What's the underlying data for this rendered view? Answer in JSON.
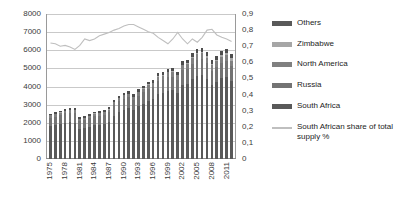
{
  "chart_data": {
    "type": "bar",
    "title": "",
    "subtitle": "",
    "xlabel": "",
    "ylabel": "",
    "y2label": "",
    "grid": true,
    "legend_position": "right",
    "ylim": [
      0,
      8000
    ],
    "yticks": [
      "0",
      "1000",
      "2000",
      "3000",
      "4000",
      "5000",
      "6000",
      "7000",
      "8000"
    ],
    "y2lim": [
      0,
      0.9
    ],
    "y2ticks": [
      "0",
      "0,1",
      "0,2",
      "0,3",
      "0,4",
      "0,5",
      "0,6",
      "0,7",
      "0,8",
      "0,9"
    ],
    "categories": [
      "1975",
      "1976",
      "1977",
      "1978",
      "1979",
      "1980",
      "1981",
      "1982",
      "1983",
      "1984",
      "1985",
      "1986",
      "1987",
      "1988",
      "1989",
      "1990",
      "1991",
      "1992",
      "1993",
      "1994",
      "1995",
      "1996",
      "1997",
      "1998",
      "1999",
      "2000",
      "2001",
      "2002",
      "2003",
      "2004",
      "2005",
      "2006",
      "2007",
      "2008",
      "2009",
      "2010",
      "2011",
      "2012"
    ],
    "xtick_labels": [
      "1975",
      "",
      "",
      "1978",
      "",
      "",
      "1981",
      "",
      "",
      "1984",
      "",
      "",
      "1987",
      "",
      "",
      "1990",
      "",
      "",
      "1993",
      "",
      "",
      "1996",
      "",
      "",
      "1999",
      "",
      "",
      "2002",
      "",
      "",
      "2005",
      "",
      "",
      "2008",
      "",
      "",
      "2011",
      ""
    ],
    "series": [
      {
        "name": "South Africa",
        "color": "#595959",
        "values": [
          1810,
          1850,
          1930,
          2010,
          2020,
          2010,
          1660,
          1690,
          1790,
          1880,
          1900,
          1940,
          2050,
          2400,
          2590,
          2710,
          2800,
          2680,
          2900,
          3050,
          3220,
          3300,
          3580,
          3640,
          3780,
          3800,
          3650,
          4100,
          4150,
          4420,
          4580,
          4620,
          4430,
          4060,
          4250,
          4450,
          4520,
          4280
        ]
      },
      {
        "name": "Russia",
        "color": "#737373",
        "values": [
          480,
          490,
          500,
          510,
          520,
          540,
          440,
          450,
          470,
          490,
          490,
          500,
          520,
          560,
          590,
          610,
          600,
          560,
          590,
          620,
          650,
          660,
          700,
          710,
          730,
          740,
          710,
          790,
          800,
          840,
          870,
          880,
          850,
          800,
          830,
          860,
          870,
          830
        ]
      },
      {
        "name": "North America",
        "color": "#808080",
        "values": [
          120,
          125,
          130,
          135,
          140,
          145,
          120,
          120,
          130,
          135,
          140,
          145,
          150,
          170,
          180,
          190,
          195,
          185,
          200,
          210,
          225,
          235,
          250,
          255,
          265,
          270,
          260,
          290,
          295,
          315,
          330,
          335,
          320,
          300,
          315,
          330,
          335,
          320
        ]
      },
      {
        "name": "Zimbabwe",
        "color": "#a6a6a6",
        "values": [
          10,
          10,
          12,
          12,
          13,
          13,
          10,
          10,
          11,
          12,
          12,
          13,
          14,
          16,
          17,
          18,
          18,
          17,
          19,
          20,
          22,
          23,
          25,
          26,
          27,
          28,
          27,
          32,
          34,
          38,
          44,
          50,
          60,
          70,
          85,
          100,
          120,
          135
        ]
      },
      {
        "name": "Others",
        "color": "#4d4d4d",
        "values": [
          90,
          95,
          98,
          100,
          105,
          108,
          90,
          92,
          96,
          100,
          102,
          105,
          110,
          120,
          128,
          135,
          138,
          130,
          140,
          148,
          155,
          160,
          170,
          175,
          182,
          186,
          180,
          200,
          205,
          218,
          230,
          235,
          226,
          212,
          222,
          232,
          236,
          225
        ]
      }
    ],
    "line_series": {
      "name": "South African share of total supply %",
      "color": "#bfbfbf",
      "axis": "right",
      "values": [
        0.72,
        0.715,
        0.7,
        0.705,
        0.695,
        0.68,
        0.705,
        0.745,
        0.735,
        0.745,
        0.765,
        0.775,
        0.785,
        0.8,
        0.81,
        0.825,
        0.835,
        0.835,
        0.82,
        0.805,
        0.79,
        0.78,
        0.755,
        0.735,
        0.715,
        0.745,
        0.785,
        0.745,
        0.715,
        0.745,
        0.725,
        0.755,
        0.8,
        0.805,
        0.77,
        0.755,
        0.745,
        0.73
      ]
    }
  },
  "legend": {
    "items": [
      {
        "label": "Others",
        "color": "#595959",
        "type": "bar"
      },
      {
        "label": "Zimbabwe",
        "color": "#a6a6a6",
        "type": "bar"
      },
      {
        "label": "North America",
        "color": "#808080",
        "type": "bar"
      },
      {
        "label": "Russia",
        "color": "#737373",
        "type": "bar"
      },
      {
        "label": "South Africa",
        "color": "#595959",
        "type": "bar"
      },
      {
        "label": "South African share of total supply %",
        "color": "#bfbfbf",
        "type": "line"
      }
    ]
  }
}
